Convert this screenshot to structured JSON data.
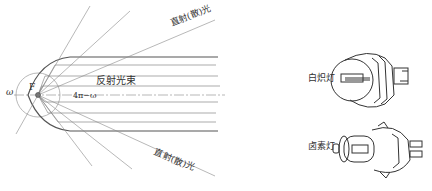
{
  "diagram": {
    "title": "",
    "reflector": {
      "focus_label": "F",
      "omega_label": "ω",
      "solid_angle_label": "4π−ω",
      "reflected_beam_label": "反射光束",
      "direct_light_top_label": "直射(散)光",
      "direct_light_bottom_label": "直射(散)光"
    },
    "bulbs": [
      {
        "name": "incandescent",
        "label": "白炽灯"
      },
      {
        "name": "halogen",
        "label": "卤素灯"
      }
    ],
    "colors": {
      "line": "#555555",
      "thin_line": "#888888",
      "background": "#ffffff"
    }
  }
}
